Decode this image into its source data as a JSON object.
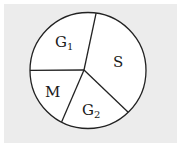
{
  "chart_data": {
    "type": "pie",
    "title": "",
    "categories": [
      "S",
      "G2",
      "M",
      "G1"
    ],
    "labels_display": [
      {
        "base": "S",
        "sub": ""
      },
      {
        "base": "G",
        "sub": "2"
      },
      {
        "base": "M",
        "sub": ""
      },
      {
        "base": "G",
        "sub": "1"
      }
    ],
    "values": [
      35.6,
      19.7,
      17.5,
      27.2
    ],
    "start_angle_deg_clockwise_from_top": 8,
    "direction": "clockwise",
    "legend": "none",
    "fill": "#ffffff",
    "stroke": "#222222",
    "background": "#ececec"
  }
}
